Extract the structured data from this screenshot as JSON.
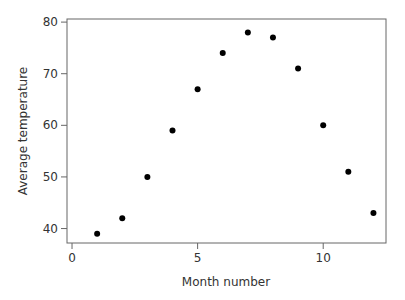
{
  "chart_data": {
    "type": "scatter",
    "title": "",
    "xlabel": "Month number",
    "ylabel": "Average temperature",
    "xlim": [
      -0.2,
      12.5
    ],
    "ylim": [
      37.2,
      80.6
    ],
    "xticks": [
      0,
      5,
      10
    ],
    "yticks": [
      40,
      50,
      60,
      70,
      80
    ],
    "grid": false,
    "legend": null,
    "marker_color": "#000000",
    "x": [
      1,
      2,
      3,
      4,
      5,
      6,
      7,
      8,
      9,
      10,
      11,
      12
    ],
    "y": [
      39,
      42,
      50,
      59,
      67,
      74,
      78,
      77,
      71,
      60,
      51,
      43
    ]
  }
}
